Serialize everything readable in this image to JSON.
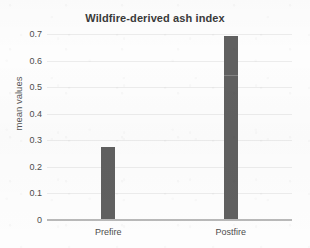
{
  "chart_data": {
    "type": "bar",
    "title": "Wildfire-derived ash index",
    "xlabel": "",
    "ylabel": "mean values",
    "categories": [
      "Prefire",
      "Postfire"
    ],
    "values": [
      0.27,
      0.69
    ],
    "series": [
      {
        "name": "mean values",
        "values": [
          0.27,
          0.69
        ]
      }
    ],
    "ylim": [
      0,
      0.7
    ],
    "yticks": [
      0,
      0.1,
      0.2,
      0.3,
      0.4,
      0.5,
      0.6,
      0.7
    ],
    "ytick_labels": [
      "0",
      "0.1",
      "0.2",
      "0.3",
      "0.4",
      "0.5",
      "0.6",
      "0.7"
    ],
    "grid": true,
    "grid_axis": "y",
    "legend": false,
    "legend_position": "none",
    "bar_color": "#606060",
    "gridline_color": "#ececec",
    "axis_color": "#b9b9b9",
    "background_color": "#fdfdfd",
    "annotations": [
      {
        "label": "faint internal segment boundary in Postfire bar",
        "category": "Postfire",
        "value": 0.54
      }
    ]
  }
}
